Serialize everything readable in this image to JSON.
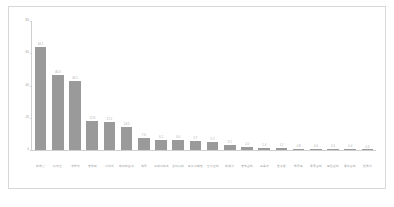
{
  "chart_data": {
    "type": "bar",
    "title": "",
    "xlabel": "",
    "ylabel": "",
    "ylim": [
      0,
      80
    ],
    "yticks": [
      0,
      20,
      40,
      60,
      80
    ],
    "grid": false,
    "legend": null,
    "bar_color": "#9a9a9a",
    "categories": [
      "마케팅",
      "디자인",
      "개발자",
      "영업직",
      "기획자",
      "데이터분석",
      "재무",
      "고객서비스",
      "엔지니어",
      "프로그래밍",
      "인사관리",
      "회계사",
      "영업관리",
      "교육자",
      "연구원",
      "법무직",
      "물류관리",
      "보안관리",
      "품질관리",
      "번역가"
    ],
    "values": [
      64.1,
      46.3,
      43.1,
      17.8,
      17.2,
      14.5,
      7.6,
      6.1,
      6.4,
      5.7,
      5.2,
      3.1,
      2.0,
      1.4,
      1.2,
      0.8,
      0.6,
      0.5,
      0.4,
      0.3
    ],
    "value_labels": [
      "64.1",
      "46.3",
      "43.1",
      "17.8",
      "17.2",
      "14.5",
      "7.6",
      "6.1",
      "6.4",
      "5.7",
      "5.2",
      "3.1",
      "2.0",
      "1.4",
      "1.2",
      "0.8",
      "0.6",
      "0.5",
      "0.4",
      "0.3"
    ]
  }
}
